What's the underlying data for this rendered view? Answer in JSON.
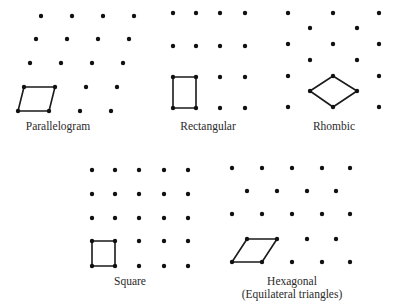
{
  "figure": {
    "lattices": [
      {
        "id": "parallelogram",
        "label": "Parallelogram",
        "label_pos": [
          58,
          120
        ],
        "points": [
          [
            41,
            16
          ],
          [
            72,
            16
          ],
          [
            103,
            16
          ],
          [
            134,
            16
          ],
          [
            36,
            39
          ],
          [
            67,
            39
          ],
          [
            98,
            39
          ],
          [
            129,
            39
          ],
          [
            30,
            63
          ],
          [
            61,
            63
          ],
          [
            92,
            63
          ],
          [
            123,
            63
          ],
          [
            24,
            87
          ],
          [
            55,
            87
          ],
          [
            86,
            87
          ],
          [
            117,
            87
          ],
          [
            18,
            111
          ],
          [
            49,
            111
          ],
          [
            80,
            111
          ],
          [
            111,
            111
          ]
        ],
        "cell": [
          [
            24,
            87
          ],
          [
            55,
            87
          ],
          [
            49,
            111
          ],
          [
            18,
            111
          ]
        ]
      },
      {
        "id": "rectangular",
        "label": "Rectangular",
        "label_pos": [
          208,
          120
        ],
        "points": [
          [
            173,
            13
          ],
          [
            196,
            13
          ],
          [
            220,
            13
          ],
          [
            245,
            13
          ],
          [
            173,
            46
          ],
          [
            196,
            46
          ],
          [
            220,
            46
          ],
          [
            245,
            46
          ],
          [
            173,
            77
          ],
          [
            196,
            77
          ],
          [
            220,
            77
          ],
          [
            245,
            77
          ],
          [
            173,
            108
          ],
          [
            196,
            108
          ],
          [
            220,
            108
          ],
          [
            245,
            108
          ]
        ],
        "cell": [
          [
            173,
            77
          ],
          [
            196,
            77
          ],
          [
            196,
            108
          ],
          [
            173,
            108
          ]
        ]
      },
      {
        "id": "rhombic",
        "label": "Rhombic",
        "label_pos": [
          334,
          120
        ],
        "points": [
          [
            288,
            13
          ],
          [
            333,
            13
          ],
          [
            379,
            13
          ],
          [
            310,
            28
          ],
          [
            357,
            28
          ],
          [
            288,
            44
          ],
          [
            333,
            44
          ],
          [
            379,
            44
          ],
          [
            310,
            60
          ],
          [
            357,
            60
          ],
          [
            288,
            76
          ],
          [
            333,
            76
          ],
          [
            379,
            76
          ],
          [
            310,
            91
          ],
          [
            357,
            91
          ],
          [
            288,
            107
          ],
          [
            333,
            107
          ],
          [
            379,
            107
          ]
        ],
        "cell": [
          [
            333,
            76
          ],
          [
            357,
            91
          ],
          [
            333,
            107
          ],
          [
            310,
            91
          ]
        ]
      },
      {
        "id": "square",
        "label": "Square",
        "label_pos": [
          130,
          275
        ],
        "points": [
          [
            92,
            170
          ],
          [
            115,
            170
          ],
          [
            139,
            170
          ],
          [
            164,
            170
          ],
          [
            188,
            170
          ],
          [
            92,
            194
          ],
          [
            115,
            194
          ],
          [
            139,
            194
          ],
          [
            164,
            194
          ],
          [
            188,
            194
          ],
          [
            92,
            218
          ],
          [
            115,
            218
          ],
          [
            139,
            218
          ],
          [
            164,
            218
          ],
          [
            188,
            218
          ],
          [
            92,
            241
          ],
          [
            115,
            241
          ],
          [
            139,
            241
          ],
          [
            164,
            241
          ],
          [
            188,
            241
          ],
          [
            92,
            266
          ],
          [
            115,
            266
          ],
          [
            139,
            266
          ],
          [
            164,
            266
          ],
          [
            188,
            266
          ]
        ],
        "cell": [
          [
            92,
            241
          ],
          [
            115,
            241
          ],
          [
            115,
            266
          ],
          [
            92,
            266
          ]
        ]
      },
      {
        "id": "hexagonal",
        "label": "Hexagonal",
        "sublabel": "(Equilateral triangles)",
        "label_pos": [
          292,
          275
        ],
        "points": [
          [
            232,
            168
          ],
          [
            262,
            168
          ],
          [
            292,
            168
          ],
          [
            322,
            168
          ],
          [
            350,
            168
          ],
          [
            247,
            191
          ],
          [
            277,
            191
          ],
          [
            307,
            191
          ],
          [
            336,
            191
          ],
          [
            232,
            214
          ],
          [
            262,
            214
          ],
          [
            292,
            214
          ],
          [
            322,
            214
          ],
          [
            350,
            214
          ],
          [
            247,
            239
          ],
          [
            277,
            239
          ],
          [
            307,
            239
          ],
          [
            336,
            239
          ],
          [
            232,
            262
          ],
          [
            262,
            262
          ],
          [
            292,
            262
          ],
          [
            322,
            262
          ],
          [
            350,
            262
          ]
        ],
        "cell": [
          [
            247,
            239
          ],
          [
            277,
            239
          ],
          [
            262,
            262
          ],
          [
            232,
            262
          ]
        ]
      }
    ],
    "style": {
      "dot_color": "#111111",
      "dot_radius": 2.2,
      "line_color": "#1a1a1a",
      "line_width": 1.6
    }
  }
}
